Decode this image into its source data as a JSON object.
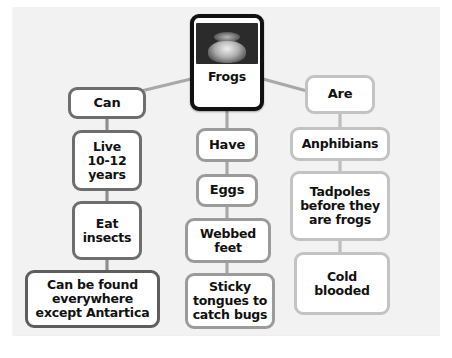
{
  "diagram": {
    "type": "concept-map",
    "topic": "Frogs",
    "background_color": "#f2f2f2",
    "root": {
      "label": "Frogs",
      "image_alt": "frog-photo",
      "border_color": "#111111"
    },
    "branches": [
      {
        "name": "can",
        "border_color": "#6e6e6e",
        "nodes": [
          {
            "label": "Can"
          },
          {
            "label": "Live\n10-12\nyears"
          },
          {
            "label": "Eat\ninsects"
          },
          {
            "label": "Can be found\neverywhere\nexcept Antartica"
          }
        ]
      },
      {
        "name": "have",
        "border_color": "#9b9b9b",
        "nodes": [
          {
            "label": "Have"
          },
          {
            "label": "Eggs"
          },
          {
            "label": "Webbed\nfeet"
          },
          {
            "label": "Sticky\ntongues to\ncatch bugs"
          }
        ]
      },
      {
        "name": "are",
        "border_color": "#c3c3c3",
        "nodes": [
          {
            "label": "Are"
          },
          {
            "label": "Anphibians"
          },
          {
            "label": "Tadpoles\nbefore they\nare frogs"
          },
          {
            "label": "Cold\nblooded"
          }
        ]
      }
    ],
    "connector_color": "#a8a8a8"
  }
}
